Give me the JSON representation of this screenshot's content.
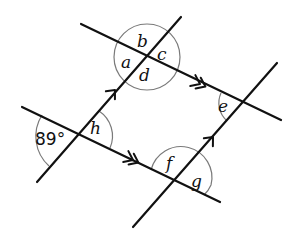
{
  "diagram": {
    "colors": {
      "line": "#111111",
      "arc": "#7a7a7a",
      "background": "#ffffff"
    },
    "lines": [
      {
        "id": "top-parallel",
        "x1": 81,
        "y1": 24,
        "x2": 281,
        "y2": 120,
        "arrows": 2
      },
      {
        "id": "bottom-parallel",
        "x1": 22,
        "y1": 107,
        "x2": 220,
        "y2": 202,
        "arrows": 2
      },
      {
        "id": "left-transversal",
        "x1": 37,
        "y1": 182,
        "x2": 181,
        "y2": 17,
        "arrows": 1
      },
      {
        "id": "right-transversal",
        "x1": 133,
        "y1": 227,
        "x2": 277,
        "y2": 63,
        "arrows": 1
      }
    ],
    "intersections": [
      {
        "id": "P1",
        "x": 147,
        "y": 57,
        "angles": [
          "a",
          "b",
          "c",
          "d"
        ]
      },
      {
        "id": "P2",
        "x": 243,
        "y": 103,
        "angles": [
          "e"
        ]
      },
      {
        "id": "P3",
        "x": 175,
        "y": 182,
        "angles": [
          "f",
          "g"
        ]
      },
      {
        "id": "P4",
        "x": 79,
        "y": 133,
        "angles": [
          "89°",
          "h"
        ]
      }
    ],
    "labels": {
      "a": "a",
      "b": "b",
      "c": "c",
      "d": "d",
      "e": "e",
      "f": "f",
      "g": "g",
      "h": "h",
      "given_angle": "89°"
    }
  }
}
